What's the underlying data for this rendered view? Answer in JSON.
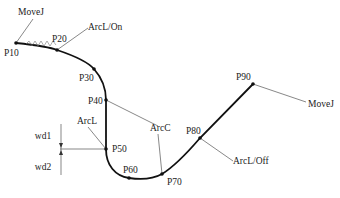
{
  "diagram": {
    "type": "robot-arc-welding-path",
    "points": [
      {
        "id": "P10",
        "label": "P10",
        "x": 16,
        "y": 43,
        "lx": 4,
        "ly": 56
      },
      {
        "id": "P20",
        "label": "P20",
        "x": 57,
        "y": 50,
        "lx": 52,
        "ly": 42
      },
      {
        "id": "P30",
        "label": "P30",
        "x": 94,
        "y": 69,
        "lx": 79,
        "ly": 81
      },
      {
        "id": "P40",
        "label": "P40",
        "x": 106,
        "y": 100,
        "lx": 88,
        "ly": 104
      },
      {
        "id": "P50",
        "label": "P50",
        "x": 106,
        "y": 149,
        "lx": 112,
        "ly": 152
      },
      {
        "id": "P60",
        "label": "P60",
        "x": 129,
        "y": 178,
        "lx": 123,
        "ly": 173
      },
      {
        "id": "P70",
        "label": "P70",
        "x": 162,
        "y": 174,
        "lx": 167,
        "ly": 185
      },
      {
        "id": "P80",
        "label": "P80",
        "x": 200,
        "y": 138,
        "lx": 186,
        "ly": 134
      },
      {
        "id": "P90",
        "label": "P90",
        "x": 253,
        "y": 84,
        "lx": 236,
        "ly": 80
      }
    ],
    "annotations": [
      {
        "id": "movej-start",
        "label": "MoveJ",
        "lx": 18,
        "ly": 15,
        "x1": 33,
        "y1": 19,
        "x2": 16,
        "y2": 43
      },
      {
        "id": "arcl-on",
        "label": "ArcL/On",
        "lx": 88,
        "ly": 30,
        "x1": 88,
        "y1": 28,
        "x2": 57,
        "y2": 50
      },
      {
        "id": "arcl",
        "label": "ArcL",
        "lx": 77,
        "ly": 124,
        "x1": 88,
        "y1": 127,
        "x2": 106,
        "y2": 149
      },
      {
        "id": "arcc",
        "label": "ArcC",
        "lx": 150,
        "ly": 131,
        "x1": 158,
        "y1": 134,
        "x2": 162,
        "y2": 174
      },
      {
        "id": "arcl-off",
        "label": "ArcL/Off",
        "lx": 233,
        "ly": 164,
        "x1": 233,
        "y1": 161,
        "x2": 200,
        "y2": 138
      },
      {
        "id": "movej-end",
        "label": "MoveJ",
        "lx": 308,
        "ly": 107,
        "x1": 306,
        "y1": 102,
        "x2": 253,
        "y2": 84
      }
    ],
    "arcc_lead2": {
      "x1": 158,
      "y1": 126,
      "x2": 106,
      "y2": 100
    },
    "dimensions": [
      {
        "id": "wd1",
        "label": "wd1",
        "lx": 43,
        "ly": 139
      },
      {
        "id": "wd2",
        "label": "wd2",
        "lx": 43,
        "ly": 170
      }
    ],
    "weave_label": "wave pattern"
  }
}
